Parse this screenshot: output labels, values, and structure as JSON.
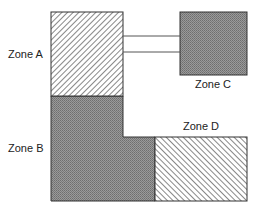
{
  "diagram": {
    "title": "",
    "zones": [
      {
        "id": "A",
        "label": "Zone A",
        "fill": "hatch-forward",
        "color": "#555555"
      },
      {
        "id": "B",
        "label": "Zone B",
        "fill": "dark-stipple",
        "color": "#8a8a8a"
      },
      {
        "id": "C",
        "label": "Zone C",
        "fill": "dark-stipple",
        "color": "#8a8a8a"
      },
      {
        "id": "D",
        "label": "Zone D",
        "fill": "hatch-backward",
        "color": "#555555"
      }
    ],
    "connectors": [
      {
        "from": "A",
        "to": "C",
        "count": 2
      }
    ]
  }
}
